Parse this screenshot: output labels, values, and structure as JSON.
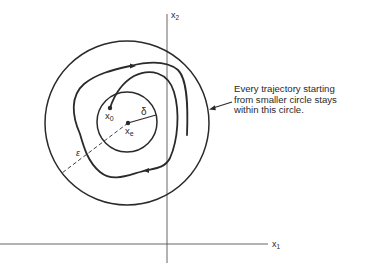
{
  "diagram": {
    "axes": {
      "x_label": "x",
      "x_sub": "1",
      "y_label": "x",
      "y_sub": "2"
    },
    "points": {
      "initial": {
        "label": "x",
        "sub": "0"
      },
      "equilibrium": {
        "label": "x",
        "sub": "e"
      }
    },
    "radii": {
      "inner": "δ",
      "outer": "ε"
    },
    "annotation": {
      "lines": [
        "Every trajectory starting",
        "from smaller circle stays",
        "within this circle."
      ]
    },
    "colors": {
      "stroke": "#2a2a2a",
      "axis": "#555555",
      "background": "#ffffff"
    }
  }
}
